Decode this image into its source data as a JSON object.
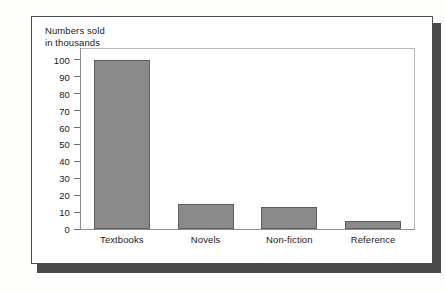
{
  "chart_data": {
    "type": "bar",
    "title": "Numbers sold\nin thousands",
    "xlabel": "",
    "ylabel": "Numbers sold in thousands",
    "categories": [
      "Textbooks",
      "Novels",
      "Non-fiction",
      "Reference"
    ],
    "values": [
      100,
      15,
      13,
      5
    ],
    "yticks": [
      0,
      10,
      20,
      30,
      40,
      50,
      60,
      70,
      80,
      90,
      100
    ],
    "ytick_labels": [
      "0",
      "10",
      "20",
      "30",
      "40",
      "50",
      "60",
      "70",
      "80",
      "90",
      "100"
    ],
    "ylim": [
      0,
      107
    ],
    "grid": false,
    "legend": null,
    "bar_color": "#8a8a8a",
    "bar_border_color": "#5e5e5e",
    "axis_color": "#8d8d8d",
    "frame_color": "#b9b9b9",
    "text_color": "#1a1a1a",
    "card_background": "#ffffff",
    "card_border_color": "#4c4c4c",
    "shadow_color": "#4a4a4a",
    "page_background": "#fdfdfb"
  }
}
